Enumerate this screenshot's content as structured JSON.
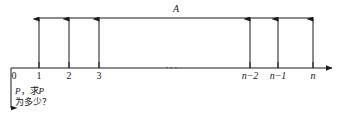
{
  "diagram": {
    "type": "number-line-with-bracket",
    "bracket_label": "A",
    "ellipsis": "···",
    "axis": {
      "y": 68,
      "x_start": 11,
      "x_end": 337,
      "arrow": "right-arrow"
    },
    "top_line": {
      "y": 18,
      "x_start": 38,
      "x_end": 313
    },
    "ticks": [
      {
        "label": "0",
        "x": 11,
        "italic": false,
        "has_arrow": false
      },
      {
        "label": "1",
        "x": 39,
        "italic": false,
        "has_arrow": true
      },
      {
        "label": "2",
        "x": 69,
        "italic": false,
        "has_arrow": true
      },
      {
        "label": "3",
        "x": 99,
        "italic": false,
        "has_arrow": true
      },
      {
        "label": "n−2",
        "x": 250,
        "italic": true,
        "has_arrow": true
      },
      {
        "label": "n−1",
        "x": 278,
        "italic": true,
        "has_arrow": true
      },
      {
        "label": "n",
        "x": 313,
        "italic": true,
        "has_arrow": true
      }
    ],
    "down_line": {
      "x": 11,
      "y_start": 68,
      "y_end": 114,
      "arrow": "down-arrow"
    }
  },
  "annotation": {
    "line1_prefix": "P",
    "line1_comma": "，",
    "line1_verb": "求",
    "line1_var": "P",
    "line2": "为多少？"
  },
  "colors": {
    "stroke": "#1a1a1a",
    "background": "#fefefe",
    "text": "#1a1a1a"
  }
}
